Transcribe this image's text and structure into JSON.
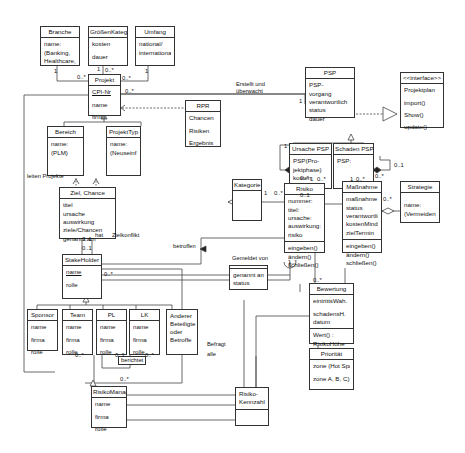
{
  "classes": {
    "branche": {
      "title": "Branche",
      "attrs": [
        "name:",
        "(Banking,",
        "Healthcare,..)"
      ]
    },
    "groessen": {
      "title": "GrößenKateg",
      "attrs": [
        "kosten",
        "dauer"
      ]
    },
    "umfang": {
      "title": "Umfang",
      "attrs": [
        "national/",
        "international"
      ]
    },
    "projekt": {
      "title": "Projekt",
      "attrs": [
        "CPI-Nr",
        "name",
        "firma"
      ]
    },
    "rpr": {
      "title": "RPR",
      "attrs": [
        "Chancen",
        "Risiken",
        "Ergebnis"
      ]
    },
    "bereich": {
      "title": "Bereich",
      "attrs": [
        "name:",
        "(PLM)"
      ]
    },
    "projekttyp": {
      "title": "ProjektTyp",
      "attrs": [
        "name:",
        "(Neuseinf.)"
      ]
    },
    "ziel": {
      "title": "Ziel, Chance",
      "attrs": [
        "titel",
        "ursache",
        "auswirkung",
        "ziele/Chancen",
        "genannt am"
      ]
    },
    "psp": {
      "title": "PSP",
      "attrs": [
        "PSP-",
        "vorgang",
        "verantwortlich",
        "status",
        "dauer"
      ]
    },
    "interface": {
      "title": "<<interface>>",
      "attrs": [
        "Projektplan",
        "import()",
        "Show()",
        "update()"
      ]
    },
    "ursache_psp": {
      "title": "Ursache PSP",
      "attrs": [
        "PSP(Pro-",
        "jektphase)",
        "kosten",
        "zeit"
      ]
    },
    "schaden_psp": {
      "title": "Schaden PSP",
      "attrs": [
        "PSP:"
      ]
    },
    "kategorie": {
      "title": "Kategorie",
      "attrs": []
    },
    "risiko": {
      "title": "Risiko",
      "attrs": [
        "nummer:",
        "titel:",
        "ursache:",
        "auswirkung:",
        "risiko"
      ],
      "ops": [
        "eingeben()",
        "ändern()",
        "schließen()"
      ]
    },
    "massnahme": {
      "title": "Maßnahme",
      "attrs": [
        "maßnahme",
        "status",
        "verantwortlich",
        "kostenMind.",
        "zielTermin"
      ],
      "ops": [
        "eingeben()",
        "ändern()",
        "schließen()"
      ]
    },
    "strategie": {
      "title": "Strategie",
      "attrs": [
        "name:",
        "(Vermeiden)"
      ]
    },
    "stakeholder": {
      "title": "StakeHolder",
      "attrs": [
        "name",
        "rolle"
      ]
    },
    "genannt": {
      "title": "",
      "attrs": [
        "genannt am",
        "status"
      ]
    },
    "sponsor": {
      "title": "Sponsor",
      "attrs": [
        "name",
        "firma",
        "rolle"
      ]
    },
    "team": {
      "title": "Team",
      "attrs": [
        "name",
        "firma",
        "rolle"
      ]
    },
    "pl": {
      "title": "PL",
      "attrs": [
        "name",
        "firma",
        "rolle"
      ]
    },
    "lk": {
      "title": "LK",
      "attrs": [
        "name",
        "firma",
        "rolle"
      ]
    },
    "andere": {
      "title": "Anderer Beteiligte oder Betroffe",
      "attrs": []
    },
    "bewertung": {
      "title": "Bewertung",
      "attrs": [
        "eintrittsWah.",
        "schadensH.",
        "datum"
      ],
      "ops": [
        "Wert() :",
        "RisikoHöhe"
      ]
    },
    "prioritaet": {
      "title": "Priorität",
      "attrs": [
        "zone (Hot Spot,",
        "zone A, B, C)"
      ]
    },
    "risikomanag": {
      "title": "RisikoManag",
      "attrs": [
        "name",
        "firma",
        "rolle"
      ]
    },
    "kennzahl": {
      "title": "Risiko-\nKennzahl",
      "attrs": []
    }
  },
  "labels": {
    "erstellt": "Erstellt und",
    "ueberwacht": "überwacht",
    "leiten": "leiten Projekte",
    "zielkonflikt": "Zielkonflikt",
    "hat": "hat",
    "betroffen": "betroffen",
    "gemeldet": "Gemeldet von",
    "befragt": "Befragt",
    "alle": "alle",
    "berichtet": "berichtet"
  },
  "multiplicities": {
    "m1": "1",
    "m2": "0..*",
    "m3": "1",
    "m4": "0..*",
    "m5": "1",
    "m6": "0..*",
    "m7": "0..*",
    "m8": "1",
    "m9": "0..1",
    "m10": "0..1",
    "m11": "1",
    "m12": "0..*",
    "m13": "1",
    "m14": "0..*",
    "m15": "1",
    "m16": "0..*",
    "m17": "0..*",
    "m18": "1",
    "m19": "1..*",
    "m20": "0..1",
    "m21": "0..1",
    "m22": "0..*",
    "m23": "0..*",
    "m24": "0..*",
    "m25": "0..1",
    "m26": "0..*",
    "m27": "0..*",
    "m28": "0..*",
    "m29": "0..*"
  }
}
